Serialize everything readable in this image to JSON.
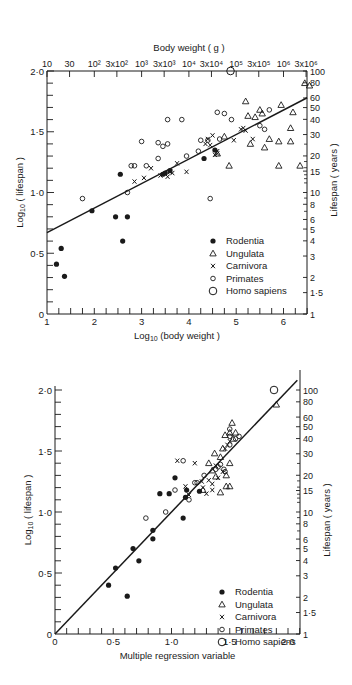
{
  "chart_data": [
    {
      "type": "scatter",
      "title": "",
      "xlabel": "Log10 (body weight)",
      "ylabel": "Log10 ( lifespan )",
      "top_xlabel": "Body weight ( g )",
      "right_ylabel": "Lifespan ( years )",
      "xlim": [
        1,
        6.5
      ],
      "ylim": [
        0,
        2.0
      ],
      "x_ticks": [
        "1",
        "2",
        "3",
        "4",
        "5",
        "6"
      ],
      "y_ticks": [
        "0",
        "0·5",
        "1·0",
        "1·5",
        "2·0"
      ],
      "top_ticks": [
        {
          "label": "10",
          "value": 1.0
        },
        {
          "label": "30",
          "value": 1.477
        },
        {
          "label": "10²",
          "value": 2.0
        },
        {
          "label": "3x10²",
          "value": 2.477
        },
        {
          "label": "10³",
          "value": 3.0
        },
        {
          "label": "3x10³",
          "value": 3.477
        },
        {
          "label": "10⁴",
          "value": 4.0
        },
        {
          "label": "3x10⁴",
          "value": 4.477
        },
        {
          "label": "10⁵",
          "value": 5.0
        },
        {
          "label": "3x10⁵",
          "value": 5.477
        },
        {
          "label": "10⁶",
          "value": 6.0
        },
        {
          "label": "3x10⁶",
          "value": 6.477
        }
      ],
      "right_ticks": [
        {
          "label": "100",
          "value": 2.0
        },
        {
          "label": "80",
          "value": 1.903
        },
        {
          "label": "60",
          "value": 1.778
        },
        {
          "label": "50",
          "value": 1.699
        },
        {
          "label": "40",
          "value": 1.602
        },
        {
          "label": "30",
          "value": 1.477
        },
        {
          "label": "20",
          "value": 1.301
        },
        {
          "label": "15",
          "value": 1.176
        },
        {
          "label": "10",
          "value": 1.0
        },
        {
          "label": "8",
          "value": 0.903
        },
        {
          "label": "6",
          "value": 0.778
        },
        {
          "label": "5",
          "value": 0.699
        },
        {
          "label": "4",
          "value": 0.602
        },
        {
          "label": "3",
          "value": 0.477
        },
        {
          "label": "2",
          "value": 0.301
        },
        {
          "label": "1·5",
          "value": 0.176
        },
        {
          "label": "1",
          "value": 0.0
        }
      ],
      "regression_line": {
        "x": [
          1.0,
          6.5
        ],
        "y": [
          0.67,
          1.78
        ]
      },
      "legend": [
        "Rodentia",
        "Ungulata",
        "Carnivora",
        "Primates",
        "Homo sapiens"
      ],
      "legend_position": "lower right",
      "grid": false,
      "series": [
        {
          "name": "Rodentia",
          "marker": "filled-circle",
          "points": [
            [
              1.2,
              0.41
            ],
            [
              1.3,
              0.54
            ],
            [
              1.37,
              0.31
            ],
            [
              1.95,
              0.85
            ],
            [
              2.45,
              0.8
            ],
            [
              2.55,
              1.15
            ],
            [
              2.6,
              0.6
            ],
            [
              2.7,
              0.8
            ],
            [
              3.45,
              1.15
            ],
            [
              3.5,
              1.16
            ],
            [
              3.6,
              1.18
            ],
            [
              4.32,
              1.28
            ],
            [
              4.55,
              1.35
            ]
          ]
        },
        {
          "name": "Ungulata",
          "marker": "triangle",
          "points": [
            [
              4.6,
              1.32
            ],
            [
              4.75,
              1.46
            ],
            [
              4.85,
              1.22
            ],
            [
              5.2,
              1.75
            ],
            [
              5.25,
              1.63
            ],
            [
              5.3,
              1.4
            ],
            [
              5.4,
              1.62
            ],
            [
              5.5,
              1.68
            ],
            [
              5.55,
              1.65
            ],
            [
              5.6,
              1.37
            ],
            [
              5.7,
              1.44
            ],
            [
              5.9,
              1.42
            ],
            [
              5.95,
              1.72
            ],
            [
              6.15,
              1.53
            ],
            [
              6.15,
              1.42
            ],
            [
              6.2,
              1.66
            ],
            [
              6.35,
              1.22
            ],
            [
              6.45,
              1.9
            ],
            [
              6.55,
              1.88
            ],
            [
              5.9,
              1.22
            ]
          ]
        },
        {
          "name": "Carnivora",
          "marker": "x",
          "points": [
            [
              2.85,
              1.09
            ],
            [
              3.05,
              1.12
            ],
            [
              3.2,
              1.2
            ],
            [
              3.4,
              1.14
            ],
            [
              3.55,
              1.13
            ],
            [
              3.6,
              1.17
            ],
            [
              3.65,
              1.16
            ],
            [
              3.75,
              1.24
            ],
            [
              3.95,
              1.17
            ],
            [
              4.35,
              1.4
            ],
            [
              4.4,
              1.44
            ],
            [
              4.45,
              1.39
            ],
            [
              4.5,
              1.47
            ],
            [
              4.55,
              1.31
            ],
            [
              4.6,
              1.32
            ],
            [
              4.6,
              1.34
            ],
            [
              4.95,
              1.43
            ],
            [
              5.1,
              1.52
            ],
            [
              5.15,
              1.53
            ],
            [
              5.2,
              1.51
            ],
            [
              5.35,
              1.44
            ]
          ]
        },
        {
          "name": "Primates",
          "marker": "small-circle",
          "points": [
            [
              1.75,
              0.95
            ],
            [
              2.7,
              1.0
            ],
            [
              2.78,
              1.22
            ],
            [
              2.85,
              1.22
            ],
            [
              3.0,
              1.42
            ],
            [
              3.1,
              1.22
            ],
            [
              3.35,
              1.41
            ],
            [
              3.45,
              1.38
            ],
            [
              3.55,
              1.4
            ],
            [
              3.55,
              1.6
            ],
            [
              3.85,
              1.6
            ],
            [
              4.25,
              1.43
            ],
            [
              4.4,
              1.43
            ],
            [
              4.45,
              0.95
            ],
            [
              4.6,
              1.66
            ],
            [
              4.65,
              1.44
            ],
            [
              4.75,
              1.65
            ],
            [
              4.9,
              1.6
            ],
            [
              5.5,
              1.55
            ],
            [
              5.6,
              1.52
            ],
            [
              5.7,
              1.68
            ],
            [
              3.35,
              1.28
            ],
            [
              3.95,
              1.3
            ],
            [
              4.2,
              1.34
            ]
          ]
        },
        {
          "name": "Homo sapiens",
          "marker": "large-circle",
          "points": [
            [
              4.88,
              2.0
            ]
          ]
        }
      ]
    },
    {
      "type": "scatter",
      "title": "",
      "xlabel": "Multiple regression variable",
      "ylabel": "Log10 ( lifespan )",
      "right_ylabel": "Lifespan ( years )",
      "xlim": [
        0,
        2.1
      ],
      "ylim": [
        0,
        2.1
      ],
      "x_ticks": [
        "0",
        "0·5",
        "1·0",
        "1·5",
        "2·0"
      ],
      "y_ticks": [
        "0",
        "0·5",
        "1·0",
        "1·5",
        "2·0"
      ],
      "right_ticks": [
        {
          "label": "100",
          "value": 2.0
        },
        {
          "label": "80",
          "value": 1.903
        },
        {
          "label": "60",
          "value": 1.778
        },
        {
          "label": "50",
          "value": 1.699
        },
        {
          "label": "40",
          "value": 1.602
        },
        {
          "label": "30",
          "value": 1.477
        },
        {
          "label": "20",
          "value": 1.301
        },
        {
          "label": "15",
          "value": 1.176
        },
        {
          "label": "10",
          "value": 1.0
        },
        {
          "label": "8",
          "value": 0.903
        },
        {
          "label": "6",
          "value": 0.778
        },
        {
          "label": "5",
          "value": 0.699
        },
        {
          "label": "4",
          "value": 0.602
        },
        {
          "label": "3",
          "value": 0.477
        },
        {
          "label": "2",
          "value": 0.301
        },
        {
          "label": "1·5",
          "value": 0.176
        },
        {
          "label": "1",
          "value": 0.0
        }
      ],
      "regression_line": {
        "x": [
          0.0,
          2.08
        ],
        "y": [
          0.0,
          2.08
        ]
      },
      "legend": [
        "Rodentia",
        "Ungulata",
        "Carnivora",
        "Primates",
        "Homo sapiens"
      ],
      "legend_position": "lower right",
      "grid": false,
      "series": [
        {
          "name": "Rodentia",
          "marker": "filled-circle",
          "points": [
            [
              0.46,
              0.4
            ],
            [
              0.52,
              0.54
            ],
            [
              0.62,
              0.31
            ],
            [
              0.67,
              0.7
            ],
            [
              0.72,
              0.6
            ],
            [
              0.84,
              0.85
            ],
            [
              0.84,
              0.78
            ],
            [
              0.9,
              1.15
            ],
            [
              0.98,
              1.15
            ],
            [
              1.03,
              1.28
            ],
            [
              1.1,
              0.95
            ],
            [
              1.13,
              1.18
            ],
            [
              1.24,
              1.17
            ],
            [
              1.12,
              1.12
            ]
          ]
        },
        {
          "name": "Ungulata",
          "marker": "triangle",
          "points": [
            [
              1.27,
              1.18
            ],
            [
              1.32,
              1.4
            ],
            [
              1.35,
              1.34
            ],
            [
              1.38,
              1.29
            ],
            [
              1.42,
              1.45
            ],
            [
              1.44,
              1.52
            ],
            [
              1.46,
              1.63
            ],
            [
              1.47,
              1.3
            ],
            [
              1.5,
              1.4
            ],
            [
              1.5,
              1.65
            ],
            [
              1.52,
              1.73
            ],
            [
              1.53,
              1.6
            ],
            [
              1.55,
              1.65
            ],
            [
              1.47,
              1.21
            ],
            [
              1.5,
              1.21
            ],
            [
              1.37,
              1.48
            ],
            [
              1.9,
              1.88
            ],
            [
              1.42,
              1.16
            ]
          ]
        },
        {
          "name": "Carnivora",
          "marker": "x",
          "points": [
            [
              1.05,
              1.42
            ],
            [
              1.12,
              1.21
            ],
            [
              1.15,
              1.14
            ],
            [
              1.2,
              1.4
            ],
            [
              1.27,
              1.2
            ],
            [
              1.3,
              1.15
            ],
            [
              1.32,
              1.26
            ],
            [
              1.35,
              1.18
            ],
            [
              1.38,
              1.38
            ],
            [
              1.4,
              1.28
            ],
            [
              1.44,
              1.33
            ],
            [
              1.48,
              1.55
            ],
            [
              1.5,
              1.58
            ],
            [
              1.26,
              1.25
            ],
            [
              1.35,
              1.23
            ],
            [
              1.46,
              1.52
            ]
          ]
        },
        {
          "name": "Primates",
          "marker": "small-circle",
          "points": [
            [
              0.78,
              0.95
            ],
            [
              0.95,
              1.0
            ],
            [
              1.03,
              1.18
            ],
            [
              1.1,
              1.42
            ],
            [
              1.15,
              1.1
            ],
            [
              1.2,
              1.24
            ],
            [
              1.22,
              1.24
            ],
            [
              1.38,
              1.35
            ],
            [
              1.4,
              1.37
            ],
            [
              1.42,
              1.39
            ],
            [
              1.45,
              1.35
            ],
            [
              1.46,
              1.33
            ],
            [
              1.5,
              1.68
            ],
            [
              1.5,
              1.62
            ],
            [
              1.55,
              1.6
            ],
            [
              1.58,
              1.62
            ],
            [
              1.28,
              1.3
            ],
            [
              1.5,
              1.55
            ]
          ]
        },
        {
          "name": "Homo sapiens",
          "marker": "large-circle",
          "points": [
            [
              1.88,
              2.0
            ]
          ]
        }
      ]
    }
  ],
  "figures": [
    {
      "top_axis_label": "Body weight ( g )",
      "bottom_axis_label": "Log",
      "bottom_axis_sub": "10",
      "bottom_axis_rest": " (body weight )",
      "left_axis_label": "Log",
      "left_axis_sub": "10",
      "left_axis_rest": " ( lifespan )",
      "right_axis_label": "Lifespan ( years )",
      "legend": [
        {
          "label": "Rodentia",
          "marker": "filled-circle"
        },
        {
          "label": "Ungulata",
          "marker": "triangle"
        },
        {
          "label": "Carnivora",
          "marker": "x"
        },
        {
          "label": "Primates",
          "marker": "small-circle"
        },
        {
          "label": "Homo sapiens",
          "marker": "large-circle"
        }
      ]
    },
    {
      "bottom_axis_label": "Multiple regression variable",
      "left_axis_label": "Log",
      "left_axis_sub": "10",
      "left_axis_rest": " ( lifespan )",
      "right_axis_label": "Lifespan ( years )",
      "legend": [
        {
          "label": "Rodentia",
          "marker": "filled-circle"
        },
        {
          "label": "Ungulata",
          "marker": "triangle"
        },
        {
          "label": "Carnivora",
          "marker": "x"
        },
        {
          "label": "Primates",
          "marker": "small-circle"
        },
        {
          "label": "Homo sapiens",
          "marker": "large-circle"
        }
      ]
    }
  ]
}
